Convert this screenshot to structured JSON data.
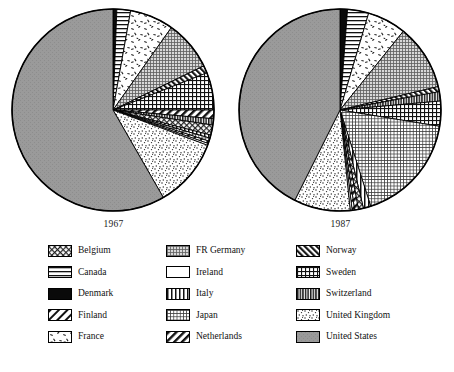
{
  "figure": {
    "type": "two-pie-panel",
    "background": "#ffffff"
  },
  "panels": [
    {
      "id": "pie-1967",
      "year_label": "1967",
      "cx": 113,
      "cy": 110,
      "r": 101
    },
    {
      "id": "pie-1987",
      "year_label": "1987",
      "cx": 340,
      "cy": 110,
      "r": 101
    }
  ],
  "legend": {
    "columns": 3,
    "entries": [
      {
        "name": "Belgium",
        "pattern": "diagonal-crosshatch"
      },
      {
        "name": "FR Germany",
        "pattern": "fine-grid-gray"
      },
      {
        "name": "Norway",
        "pattern": "dense-diagonal-back"
      },
      {
        "name": "Canada",
        "pattern": "horizontal-lines"
      },
      {
        "name": "Ireland",
        "pattern": "white"
      },
      {
        "name": "Sweden",
        "pattern": "crosshatch-grid"
      },
      {
        "name": "Denmark",
        "pattern": "solid-black"
      },
      {
        "name": "Italy",
        "pattern": "vertical-lines"
      },
      {
        "name": "Switzerland",
        "pattern": "dense-vertical"
      },
      {
        "name": "Finland",
        "pattern": "diagonal-hatch"
      },
      {
        "name": "Japan",
        "pattern": "fine-dot-grid"
      },
      {
        "name": "United Kingdom",
        "pattern": "stipple"
      },
      {
        "name": "France",
        "pattern": "sparse-speckle"
      },
      {
        "name": "Netherlands",
        "pattern": "bold-diagonal"
      },
      {
        "name": "United States",
        "pattern": "solid-gray"
      }
    ]
  },
  "chart_data": {
    "type": "pie",
    "title": "",
    "subtitle": "",
    "xlabel": "",
    "ylabel": "",
    "legend_position": "bottom",
    "grid": false,
    "unit": "percent share",
    "categories": [
      "Denmark",
      "Canada",
      "France",
      "FR Germany",
      "Norway",
      "Sweden",
      "Netherlands",
      "Switzerland",
      "Belgium",
      "Italy",
      "Japan",
      "Finland",
      "Ireland",
      "United Kingdom",
      "United States"
    ],
    "series": [
      {
        "name": "1967",
        "values": [
          0.6,
          2.2,
          7.0,
          8.0,
          1.2,
          6.0,
          1.4,
          1.0,
          1.6,
          0.5,
          0.5,
          0.4,
          0.3,
          11.0,
          58.3
        ]
      },
      {
        "name": "1987",
        "values": [
          1.2,
          3.4,
          6.2,
          10.5,
          0.8,
          4.0,
          0.6,
          1.5,
          0.8,
          1.2,
          17.5,
          0.4,
          0.3,
          9.0,
          42.6
        ]
      }
    ],
    "slices_1967": [
      {
        "label": "Denmark",
        "start_deg": 0.0,
        "sweep_deg": 2.2,
        "pattern": "solid-black"
      },
      {
        "label": "Canada",
        "start_deg": 2.2,
        "sweep_deg": 7.9,
        "pattern": "horizontal-lines"
      },
      {
        "label": "France",
        "start_deg": 10.1,
        "sweep_deg": 25.2,
        "pattern": "sparse-speckle"
      },
      {
        "label": "FR Germany",
        "start_deg": 35.3,
        "sweep_deg": 28.8,
        "pattern": "fine-grid-gray"
      },
      {
        "label": "Norway",
        "start_deg": 64.1,
        "sweep_deg": 4.3,
        "pattern": "dense-diagonal-back"
      },
      {
        "label": "Sweden",
        "start_deg": 68.4,
        "sweep_deg": 21.6,
        "pattern": "crosshatch-grid"
      },
      {
        "label": "Netherlands",
        "start_deg": 90.0,
        "sweep_deg": 5.0,
        "pattern": "bold-diagonal"
      },
      {
        "label": "Switzerland",
        "start_deg": 95.0,
        "sweep_deg": 3.6,
        "pattern": "dense-vertical"
      },
      {
        "label": "Belgium",
        "start_deg": 98.6,
        "sweep_deg": 5.8,
        "pattern": "diagonal-crosshatch"
      },
      {
        "label": "Italy",
        "start_deg": 104.4,
        "sweep_deg": 1.8,
        "pattern": "vertical-lines"
      },
      {
        "label": "Japan",
        "start_deg": 106.2,
        "sweep_deg": 1.8,
        "pattern": "fine-dot-grid"
      },
      {
        "label": "Finland",
        "start_deg": 108.0,
        "sweep_deg": 1.4,
        "pattern": "diagonal-hatch"
      },
      {
        "label": "Ireland",
        "start_deg": 109.4,
        "sweep_deg": 1.1,
        "pattern": "white"
      },
      {
        "label": "United Kingdom",
        "start_deg": 110.5,
        "sweep_deg": 39.6,
        "pattern": "stipple"
      },
      {
        "label": "United States",
        "start_deg": 150.1,
        "sweep_deg": 209.9,
        "pattern": "solid-gray"
      }
    ],
    "slices_1987": [
      {
        "label": "Denmark",
        "start_deg": 0.0,
        "sweep_deg": 4.3,
        "pattern": "solid-black"
      },
      {
        "label": "Canada",
        "start_deg": 4.3,
        "sweep_deg": 12.2,
        "pattern": "horizontal-lines"
      },
      {
        "label": "France",
        "start_deg": 16.5,
        "sweep_deg": 22.3,
        "pattern": "sparse-speckle"
      },
      {
        "label": "FR Germany",
        "start_deg": 38.8,
        "sweep_deg": 37.8,
        "pattern": "fine-grid-gray"
      },
      {
        "label": "Norway",
        "start_deg": 76.6,
        "sweep_deg": 2.9,
        "pattern": "dense-diagonal-back"
      },
      {
        "label": "Switzerland",
        "start_deg": 79.5,
        "sweep_deg": 5.4,
        "pattern": "dense-vertical"
      },
      {
        "label": "Sweden",
        "start_deg": 84.9,
        "sweep_deg": 14.4,
        "pattern": "crosshatch-grid"
      },
      {
        "label": "Japan",
        "start_deg": 99.3,
        "sweep_deg": 63.0,
        "pattern": "fine-dot-grid"
      },
      {
        "label": "Italy",
        "start_deg": 162.3,
        "sweep_deg": 4.3,
        "pattern": "vertical-lines"
      },
      {
        "label": "Belgium",
        "start_deg": 166.6,
        "sweep_deg": 2.9,
        "pattern": "diagonal-crosshatch"
      },
      {
        "label": "Netherlands",
        "start_deg": 169.5,
        "sweep_deg": 2.2,
        "pattern": "bold-diagonal"
      },
      {
        "label": "Finland",
        "start_deg": 171.7,
        "sweep_deg": 1.4,
        "pattern": "diagonal-hatch"
      },
      {
        "label": "Ireland",
        "start_deg": 173.1,
        "sweep_deg": 1.1,
        "pattern": "white"
      },
      {
        "label": "United Kingdom",
        "start_deg": 174.2,
        "sweep_deg": 32.4,
        "pattern": "stipple"
      },
      {
        "label": "United States",
        "start_deg": 206.6,
        "sweep_deg": 153.4,
        "pattern": "solid-gray"
      }
    ]
  }
}
